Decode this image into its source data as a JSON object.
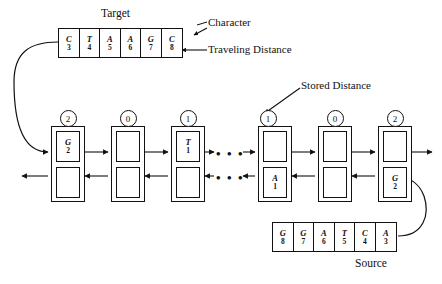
{
  "figure": {
    "title_target": "Target",
    "title_source": "Source",
    "annotations": {
      "character": "Character",
      "traveling_distance": "Traveling Distance",
      "stored_distance": "Stored Distance"
    },
    "ellipsis": "• • •",
    "colors": {
      "ink": "#111111",
      "paper": "#ffffff"
    }
  },
  "target_sequence": {
    "label": "Target",
    "cells": [
      {
        "char": "C",
        "num": "3"
      },
      {
        "char": "T",
        "num": "4"
      },
      {
        "char": "A",
        "num": "5"
      },
      {
        "char": "A",
        "num": "6"
      },
      {
        "char": "G",
        "num": "7"
      },
      {
        "char": "C",
        "num": "8"
      }
    ]
  },
  "source_sequence": {
    "label": "Source",
    "cells": [
      {
        "char": "G",
        "num": "8"
      },
      {
        "char": "G",
        "num": "7"
      },
      {
        "char": "A",
        "num": "6"
      },
      {
        "char": "T",
        "num": "5"
      },
      {
        "char": "C",
        "num": "4"
      },
      {
        "char": "A",
        "num": "3"
      }
    ]
  },
  "nodes": [
    {
      "stored_distance": "2",
      "top_cell": {
        "char": "G",
        "num": "2"
      },
      "bottom_cell": {
        "char": "",
        "num": ""
      }
    },
    {
      "stored_distance": "0",
      "top_cell": {
        "char": "",
        "num": ""
      },
      "bottom_cell": {
        "char": "",
        "num": ""
      }
    },
    {
      "stored_distance": "1",
      "top_cell": {
        "char": "T",
        "num": "1"
      },
      "bottom_cell": {
        "char": "",
        "num": ""
      }
    },
    {
      "stored_distance": "1",
      "top_cell": {
        "char": "",
        "num": ""
      },
      "bottom_cell": {
        "char": "A",
        "num": "1"
      }
    },
    {
      "stored_distance": "0",
      "top_cell": {
        "char": "",
        "num": ""
      },
      "bottom_cell": {
        "char": "",
        "num": ""
      }
    },
    {
      "stored_distance": "2",
      "top_cell": {
        "char": "",
        "num": ""
      },
      "bottom_cell": {
        "char": "G",
        "num": "2"
      }
    }
  ]
}
